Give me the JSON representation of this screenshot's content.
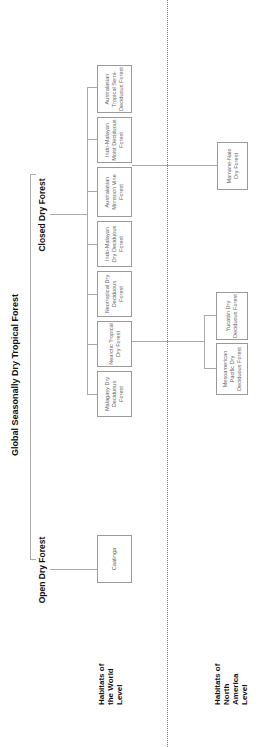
{
  "title": "Global Seasonally Dry Tropical Forest",
  "branches": {
    "closed": "Closed Dry Forest",
    "open": "Open Dry Forest"
  },
  "levels": {
    "world": "Habitats of the World Level",
    "north_america": "Habitats of North America Level"
  },
  "world_habitats": [
    {
      "label": "Malagasy Dry Deciduous Forest"
    },
    {
      "label": "Nearctic Tropical Dry Forest"
    },
    {
      "label": "Neotropical Dry Deciduous Forest"
    },
    {
      "label": "Indo-Malayan Dry Deciduous Forest"
    },
    {
      "label": "Australasian Monsoon Vine Forest"
    },
    {
      "label": "Indo-Malayan Moist Deciduous Forest"
    },
    {
      "label": "Australasian Tropical Semi-Deciduous Forest"
    }
  ],
  "open_habitats": [
    {
      "label": "Caatinga"
    }
  ],
  "north_america_habitats": {
    "nearctic_children": [
      {
        "label": "Mesoamerican Pacific Dry Deciduous Forest"
      },
      {
        "label": "Yucatán Dry Deciduous Forest"
      }
    ],
    "indomalayan_children": [
      {
        "label": "Mamane-Naio Dry Forest"
      }
    ]
  },
  "colors": {
    "box_border": "#9a9a9a",
    "line": "#aaaaaa",
    "text": "#111111",
    "box_text": "#666666"
  }
}
